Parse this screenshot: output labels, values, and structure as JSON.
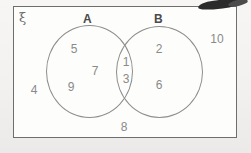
{
  "diagram": {
    "type": "venn-diagram",
    "universe_symbol": "ξ",
    "sets": [
      {
        "id": "A",
        "label": "A"
      },
      {
        "id": "B",
        "label": "B"
      }
    ],
    "regions": {
      "a_only": {
        "name": "A only",
        "elements": [
          "5",
          "7",
          "9"
        ]
      },
      "intersection": {
        "name": "A intersect B",
        "elements": [
          "1",
          "3"
        ]
      },
      "b_only": {
        "name": "B only",
        "elements": [
          "2",
          "6"
        ]
      },
      "outside": {
        "name": "outside A and B",
        "elements": [
          "4",
          "8",
          "10"
        ]
      }
    },
    "elements": {
      "e1": "1",
      "e2": "2",
      "e3": "3",
      "e4": "4",
      "e5": "5",
      "e6": "6",
      "e7": "7",
      "e8": "8",
      "e9": "9",
      "e10": "10"
    },
    "colors": {
      "rectangle_border": "#6e6e6e",
      "circle_border": "#8d8d8d",
      "element_text": "#8a8a8a",
      "label_text": "#4a4a4a",
      "page_background": "#f5f4f2",
      "rectangle_fill": "#fdfdfc"
    }
  }
}
